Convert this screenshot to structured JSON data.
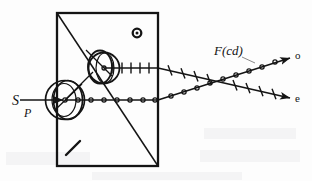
{
  "figure": {
    "title_text": "",
    "canvas": {
      "width": 312,
      "height": 181,
      "background": "#fdfdfd"
    },
    "ink_color": "#141414",
    "labels": {
      "source": "S",
      "polarization": "P",
      "wavefront": "F(cd)",
      "ordinary_ray": "o",
      "extraordinary_ray": "e"
    },
    "label_positions": {
      "source": {
        "x": 12,
        "y": 103
      },
      "polarization": {
        "x": 24,
        "y": 114
      },
      "wavefront": {
        "x": 215,
        "y": 53
      },
      "ordinary_ray": {
        "x": 296,
        "y": 60
      },
      "extraordinary_ray": {
        "x": 296,
        "y": 100
      }
    },
    "crystal": {
      "name": "crystal-slab",
      "x": 57,
      "y": 13,
      "width": 101,
      "height": 153,
      "stroke_width": 2.2,
      "diagonal": {
        "x1": 57,
        "y1": 13,
        "x2": 158,
        "y2": 166
      },
      "optic_axis_marker": {
        "x1": 66,
        "y1": 155,
        "x2": 80,
        "y2": 141
      },
      "out_of_plane_dot": {
        "cx": 137,
        "cy": 33,
        "r_outer": 4.2,
        "r_inner": 1.5
      }
    },
    "rays": {
      "incident": {
        "x1": 20,
        "y1": 100,
        "x2": 65,
        "y2": 100
      },
      "ordinary_inside": {
        "x1": 65,
        "y1": 100,
        "x2": 158,
        "y2": 100
      },
      "ordinary_outside": {
        "x1": 158,
        "y1": 100,
        "x2": 292,
        "y2": 58
      },
      "extraordinary_inside": {
        "x1": 104,
        "y1": 68,
        "x2": 158,
        "y2": 68
      },
      "extraordinary_outside": {
        "x1": 158,
        "y1": 68,
        "x2": 292,
        "y2": 98
      },
      "crossing_point": {
        "x": 225,
        "y": 84
      },
      "ordinary_marker": "dot",
      "extraordinary_marker": "tick"
    },
    "wavelets": [
      {
        "name": "lower-wavelet-cluster",
        "cx": 65,
        "cy": 100
      },
      {
        "name": "upper-wavelet-cluster",
        "cx": 104,
        "cy": 68
      }
    ]
  }
}
